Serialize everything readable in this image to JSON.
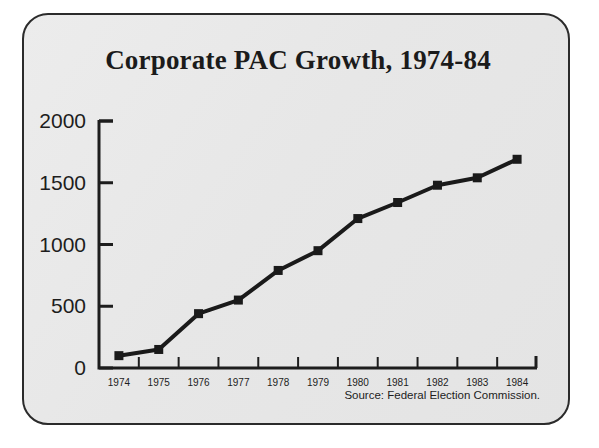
{
  "card": {
    "background_color": "#e9e9e9",
    "border_color": "#2b2b2b"
  },
  "title": "Corporate PAC Growth, 1974-84",
  "source_note": "Source: Federal Election Commission.",
  "axis": {
    "y_ticks": [
      "0",
      "500",
      "1000",
      "1500",
      "2000"
    ],
    "x_ticks": [
      "1974",
      "1975",
      "1976",
      "1977",
      "1978",
      "1979",
      "1980",
      "1981",
      "1982",
      "1983",
      "1984"
    ]
  },
  "chart_data": {
    "type": "line",
    "title": "Corporate PAC Growth, 1974-84",
    "xlabel": "",
    "ylabel": "",
    "categories": [
      "1974",
      "1975",
      "1976",
      "1977",
      "1978",
      "1979",
      "1980",
      "1981",
      "1982",
      "1983",
      "1984"
    ],
    "values": [
      100,
      150,
      440,
      550,
      790,
      950,
      1210,
      1340,
      1480,
      1540,
      1690
    ],
    "series": [
      {
        "name": "Corporate PACs",
        "values": [
          100,
          150,
          440,
          550,
          790,
          950,
          1210,
          1340,
          1480,
          1540,
          1690
        ]
      }
    ],
    "ylim": [
      0,
      2000
    ],
    "y_tick_values": [
      0,
      500,
      1000,
      1500,
      2000
    ],
    "grid": false,
    "legend": "none",
    "line_color": "#1a1a1a",
    "marker": "square",
    "marker_color": "#1a1a1a",
    "annotations": [
      "Source: Federal Election Commission."
    ]
  }
}
